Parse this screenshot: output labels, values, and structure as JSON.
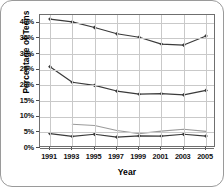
{
  "chart_data": {
    "type": "line",
    "title": "",
    "xlabel": "Year",
    "ylabel": "Percentage of Teens",
    "x": [
      1991,
      1993,
      1995,
      1997,
      1999,
      2001,
      2003,
      2005
    ],
    "xtick_labels": [
      "1991",
      "1993",
      "1995",
      "1997",
      "1999",
      "2001",
      "2003",
      "2005"
    ],
    "ytick_labels": [
      "0%",
      "5%",
      "10%",
      "15%",
      "20%",
      "25%",
      "30%",
      "35%",
      "40%"
    ],
    "ytick_values": [
      0,
      5,
      10,
      15,
      20,
      25,
      30,
      35,
      40
    ],
    "ylim": [
      0,
      42.5
    ],
    "ypercent_suffix": "%",
    "grid": true,
    "legend": "none",
    "series": [
      {
        "name": "series-1",
        "color": "#3a3a3a",
        "marker": "diamond",
        "values": [
          41.2,
          40.3,
          38.5,
          36.5,
          35.4,
          33.2,
          32.9,
          35.8
        ]
      },
      {
        "name": "series-2",
        "color": "#3a3a3a",
        "marker": "diamond",
        "values": [
          26.0,
          21.0,
          20.0,
          18.2,
          17.2,
          17.4,
          17.0,
          18.4
        ]
      },
      {
        "name": "series-3",
        "color": "#9b9b9b",
        "marker": "none",
        "values": [
          null,
          7.6,
          7.2,
          5.6,
          4.6,
          5.4,
          6.0,
          5.3
        ]
      },
      {
        "name": "series-4",
        "color": "#3a3a3a",
        "marker": "diamond",
        "values": [
          4.6,
          3.7,
          4.4,
          3.5,
          3.9,
          3.8,
          4.4,
          3.8
        ]
      }
    ]
  }
}
